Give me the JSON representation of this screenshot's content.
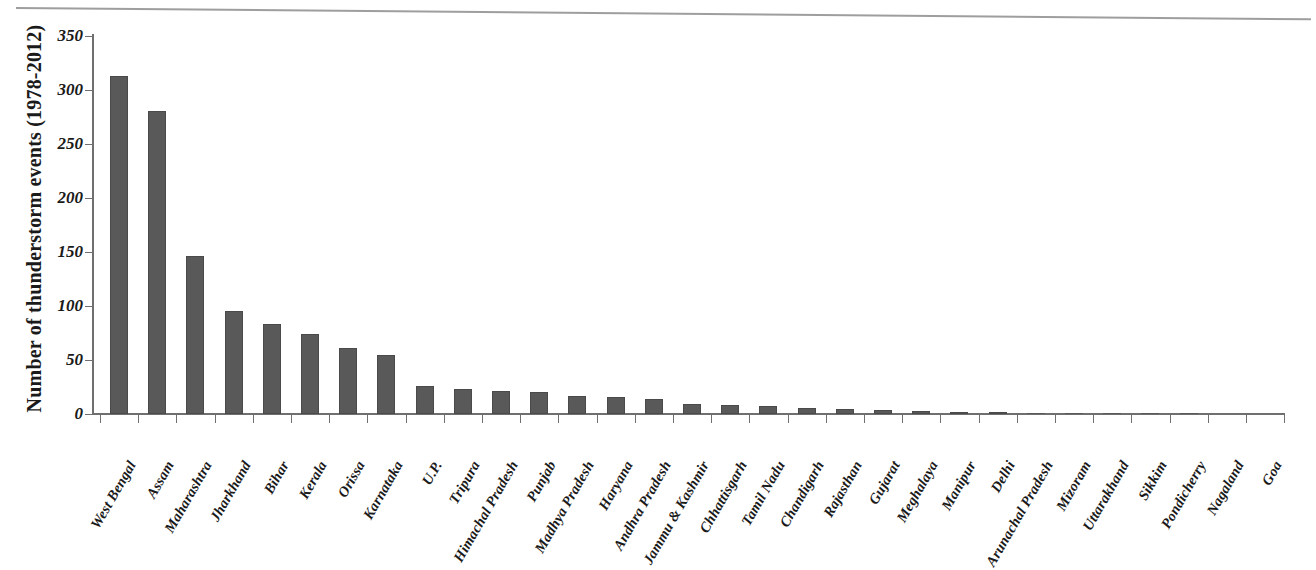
{
  "chart_data": {
    "type": "bar",
    "title": "",
    "xlabel": "",
    "ylabel": "Number of thunderstorm events (1978-2012)",
    "ylim": [
      0,
      350
    ],
    "ytick_labels": [
      "350",
      "300",
      "250",
      "200",
      "150",
      "100",
      "50",
      "0"
    ],
    "yticks": [
      350,
      300,
      250,
      200,
      150,
      100,
      50,
      0
    ],
    "grid": false,
    "legend": "none",
    "bar_color": "#595959",
    "categories": [
      "West Bengal",
      "Assam",
      "Maharashtra",
      "Jharkhand",
      "Bihar",
      "Kerala",
      "Orissa",
      "Karnataka",
      "U.P.",
      "Tripura",
      "Himachal Pradesh",
      "Punjab",
      "Madhya Pradesh",
      "Haryana",
      "Andhra Pradesh",
      "Jammu & Kashmir",
      "Chhattisgarh",
      "Tamil Nadu",
      "Chandigarh",
      "Rajasthan",
      "Gujarat",
      "Meghalaya",
      "Manipur",
      "Delhi",
      "Arunachal Pradesh",
      "Mizoram",
      "Uttarakhand",
      "Sikkim",
      "Pondicherry",
      "Nagaland",
      "Goa"
    ],
    "values": [
      313,
      281,
      146,
      95,
      83,
      74,
      61,
      55,
      26,
      23,
      21,
      20,
      17,
      16,
      14,
      9,
      8,
      7,
      6,
      5,
      4,
      3,
      2,
      2,
      1,
      1,
      1,
      1,
      1,
      0,
      0
    ]
  }
}
